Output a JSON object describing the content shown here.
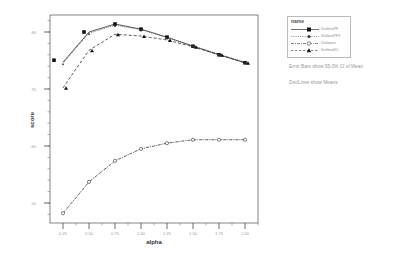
{
  "chart_data": {
    "type": "line",
    "title": "",
    "xlabel": "alpha",
    "ylabel": "score",
    "x": [
      0.25,
      0.5,
      0.75,
      1.0,
      1.25,
      1.5,
      1.75,
      2.0
    ],
    "x_tick_labels": [
      "0.25",
      "0.50",
      "0.75",
      "1.00",
      "1.25",
      "1.50",
      "1.75",
      "2.00"
    ],
    "y_tick_labels": [
      ".80",
      ".70",
      ".60",
      ".50"
    ],
    "y_ticks": [
      0.8,
      0.7,
      0.6,
      0.5
    ],
    "ylim": [
      0.465,
      0.83
    ],
    "xlim": [
      0.125,
      2.125
    ],
    "grid": false,
    "legend_title": "name",
    "legend_position": "right",
    "series": [
      {
        "name": "DistlessPF",
        "line": "solid",
        "marker": "square",
        "values": [
          0.747,
          0.8,
          0.814,
          0.805,
          0.791,
          0.775,
          0.76,
          0.746
        ]
      },
      {
        "name": "DistlessPF2",
        "line": "dotted",
        "marker": "circle",
        "values": [
          0.745,
          0.798,
          0.812,
          0.804,
          0.79,
          0.776,
          0.761,
          0.747
        ]
      },
      {
        "name": "Distloose",
        "line": "dashdot",
        "marker": "diamond",
        "values": [
          0.482,
          0.537,
          0.574,
          0.595,
          0.605,
          0.611,
          0.611,
          0.611
        ]
      },
      {
        "name": "DistlessKC",
        "line": "dashed",
        "marker": "triangle",
        "values": [
          0.702,
          0.768,
          0.796,
          0.793,
          0.786,
          0.774,
          0.76,
          0.746
        ]
      }
    ],
    "annotations": [
      "Error Bars show 95.0% CI of Mean",
      "Dot/Lines show Means"
    ]
  },
  "legend": {
    "title": "name",
    "items": [
      "DistlessPF",
      "DistlessPF2",
      "Distloose",
      "DistlessKC"
    ]
  },
  "notes": {
    "error_bars": "Error Bars show 95.0% CI of Mean",
    "dot_lines": "Dot/Lines show Means"
  }
}
